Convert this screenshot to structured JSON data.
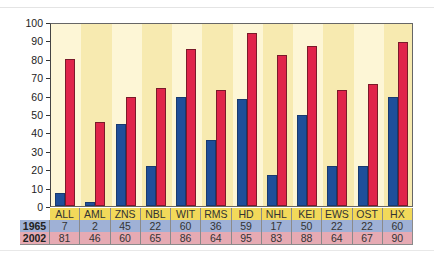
{
  "chart_data": {
    "type": "bar",
    "title": "",
    "xlabel": "",
    "ylabel": "",
    "ylim": [
      0,
      100
    ],
    "yticks": [
      0,
      10,
      20,
      30,
      40,
      50,
      60,
      70,
      80,
      90,
      100
    ],
    "grid": false,
    "legend_position": "table-below",
    "categories": [
      "ALL",
      "AML",
      "ZNS",
      "NBL",
      "WIT",
      "RMS",
      "HD",
      "NHL",
      "KEI",
      "EWS",
      "OST",
      "HX"
    ],
    "series": [
      {
        "name": "1965",
        "color": "#1f4f9a",
        "values": [
          7,
          2,
          45,
          22,
          60,
          36,
          59,
          17,
          50,
          22,
          22,
          60
        ]
      },
      {
        "name": "2002",
        "color": "#e0244a",
        "values": [
          81,
          46,
          60,
          65,
          86,
          64,
          95,
          83,
          88,
          64,
          67,
          90
        ]
      }
    ]
  },
  "colors": {
    "column_light": "#fdf6d6",
    "column_dark": "#f7eab0",
    "category_row": "#f2d95a",
    "row_1965": "#9fb1d6",
    "row_2002": "#e6aab3"
  },
  "table": {
    "rows": [
      {
        "label": "1965"
      },
      {
        "label": "2002"
      }
    ]
  }
}
